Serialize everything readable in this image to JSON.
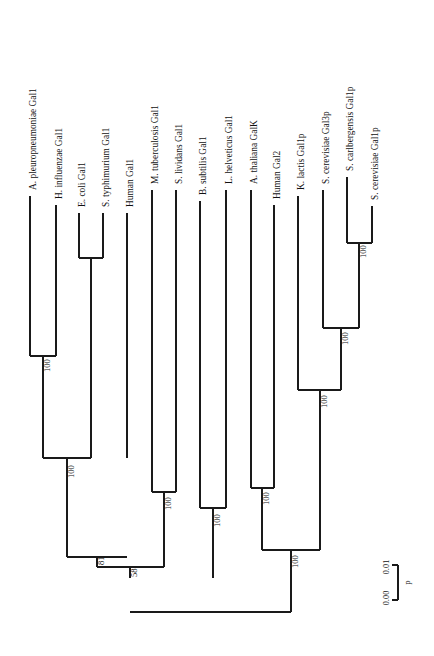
{
  "figure": {
    "kind": "phylogenetic-tree",
    "orientation": "rotated-90-ccw",
    "background_color": "#ffffff",
    "line_color": "#1a1a1a"
  },
  "tips": [
    {
      "id": "t1",
      "genus": "A. pleuropneumoniae",
      "gene": "Gal1",
      "italic": true,
      "x": 30,
      "tip_y": 196,
      "node_y": 356
    },
    {
      "id": "t2",
      "genus": "H. influenzae",
      "gene": "Gal1",
      "italic": true,
      "x": 56,
      "tip_y": 205,
      "node_y": 356
    },
    {
      "id": "t3",
      "genus": "E. coli",
      "gene": "Gal1",
      "italic": true,
      "x": 79,
      "tip_y": 213,
      "node_y": 258
    },
    {
      "id": "t4",
      "genus": "S. typhimurium",
      "gene": "Gal1",
      "italic": true,
      "x": 103,
      "tip_y": 213,
      "node_y": 258
    },
    {
      "id": "t5",
      "genus": "Human",
      "gene": "Gal1",
      "italic": false,
      "x": 127,
      "tip_y": 213,
      "node_y": 458
    },
    {
      "id": "t6",
      "genus": "M. tuberculosis",
      "gene": "Gal1",
      "italic": true,
      "x": 152,
      "tip_y": 190,
      "node_y": 492
    },
    {
      "id": "t7",
      "genus": "S. lividans",
      "gene": "Gal1",
      "italic": true,
      "x": 176,
      "tip_y": 190,
      "node_y": 492
    },
    {
      "id": "t8",
      "genus": "B. subtilis",
      "gene": "Gal1",
      "italic": true,
      "x": 200,
      "tip_y": 201,
      "node_y": 508
    },
    {
      "id": "t9",
      "genus": "L. helveticus",
      "gene": "Gal1",
      "italic": true,
      "x": 226,
      "tip_y": 190,
      "node_y": 508
    },
    {
      "id": "t10",
      "genus": "A. thaliana",
      "gene": "GalK",
      "italic": true,
      "x": 251,
      "tip_y": 190,
      "node_y": 488
    },
    {
      "id": "t11",
      "genus": "Human",
      "gene": "Gal2",
      "italic": false,
      "x": 274,
      "tip_y": 205,
      "node_y": 488
    },
    {
      "id": "t12",
      "genus": "K. lactis",
      "gene": "Gal1p",
      "italic": true,
      "x": 298,
      "tip_y": 196,
      "node_y": 390
    },
    {
      "id": "t13",
      "genus": "S. cerevisiae",
      "gene": "Gal3p",
      "italic": true,
      "x": 323,
      "tip_y": 190,
      "node_y": 328
    },
    {
      "id": "t14",
      "genus": "S. carlbergensis",
      "gene": "Gal1p",
      "italic": true,
      "x": 347,
      "tip_y": 177,
      "node_y": 243
    },
    {
      "id": "t15",
      "genus": "S. cerevisiae",
      "gene": "Gal1p",
      "italic": true,
      "x": 372,
      "tip_y": 206,
      "node_y": 243
    }
  ],
  "clades": [
    {
      "id": "c_apl_hin",
      "x1": 30,
      "x2": 56,
      "y": 356,
      "stem_x": 43,
      "stem_to": 458,
      "boot": "100",
      "boot_x": 48,
      "boot_y": 372
    },
    {
      "id": "c_eco_sty",
      "x1": 79,
      "x2": 103,
      "y": 258,
      "stem_x": 91,
      "stem_to": 458,
      "boot": "",
      "boot_x": 0,
      "boot_y": 0
    },
    {
      "id": "c_gamma",
      "x1": 43,
      "x2": 91,
      "y": 458,
      "stem_x": 67,
      "stem_to": 557,
      "boot": "100",
      "boot_x": 72,
      "boot_y": 478
    },
    {
      "id": "c_mtb_sli",
      "x1": 152,
      "x2": 176,
      "y": 492,
      "stem_x": 164,
      "stem_to": 567,
      "boot": "100",
      "boot_x": 169,
      "boot_y": 510
    },
    {
      "id": "c_bsu_lhe",
      "x1": 200,
      "x2": 226,
      "y": 508,
      "stem_x": 213,
      "stem_to": 578,
      "boot": "100",
      "boot_x": 218,
      "boot_y": 527
    },
    {
      "id": "c_bact81",
      "x1": 67,
      "x2": 127,
      "y": 557,
      "stem_x": 97,
      "stem_to": 567,
      "boot": "81",
      "boot_x": 102,
      "boot_y": 565
    },
    {
      "id": "c_bact58",
      "x1": 97,
      "x2": 164,
      "y": 567,
      "stem_x": 130,
      "stem_to": 578,
      "boot": "58",
      "boot_x": 135,
      "boot_y": 577
    },
    {
      "id": "c_athal_hgal2",
      "x1": 251,
      "x2": 274,
      "y": 488,
      "stem_x": 262,
      "stem_to": 550,
      "boot": "100",
      "boot_x": 267,
      "boot_y": 505
    },
    {
      "id": "c_scar_scer",
      "x1": 347,
      "x2": 372,
      "y": 243,
      "stem_x": 359,
      "stem_to": 328,
      "boot": "100",
      "boot_x": 364,
      "boot_y": 258
    },
    {
      "id": "c_yeast3",
      "x1": 323,
      "x2": 359,
      "y": 328,
      "stem_x": 341,
      "stem_to": 390,
      "boot": "100",
      "boot_x": 346,
      "boot_y": 345
    },
    {
      "id": "c_yeast_all",
      "x1": 298,
      "x2": 341,
      "y": 390,
      "stem_x": 320,
      "stem_to": 550,
      "boot": "100",
      "boot_x": 325,
      "boot_y": 408
    },
    {
      "id": "c_euk",
      "x1": 262,
      "x2": 320,
      "y": 550,
      "stem_x": 291,
      "stem_to": 612,
      "boot": "100",
      "boot_x": 296,
      "boot_y": 568
    },
    {
      "id": "c_root",
      "x1": 130,
      "x2": 291,
      "y": 612,
      "stem_x": 130,
      "stem_to": 612,
      "boot": "",
      "boot_x": 0,
      "boot_y": 0
    }
  ],
  "bootstrap_values": [
    "100",
    "100",
    "100",
    "100",
    "81",
    "58",
    "100",
    "100",
    "100",
    "100",
    "100"
  ],
  "scale_bar": {
    "left_label": "0.00",
    "right_label": "0.01",
    "unit_label": "p",
    "x": 392,
    "y_top": 565,
    "y_bottom": 600
  }
}
